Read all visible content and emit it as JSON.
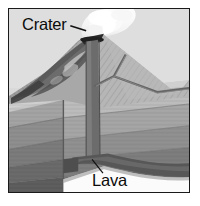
{
  "figure": {
    "kind": "labeled-diagram",
    "frame": {
      "border_color": "#1a1a1a",
      "background_color": "#d9d9d9"
    }
  },
  "labels": [
    {
      "id": "crater",
      "text": "Crater",
      "color": "#0b0b0b",
      "leader": "line from text right edge to volcano summit vent"
    },
    {
      "id": "lava",
      "text": "Lava",
      "color": "#0b0b0b",
      "leader": "line from text up-right to the magma conduit base"
    }
  ],
  "scene": {
    "sky_color": "#d8d8d8",
    "plume": {
      "name": "smoke-plume",
      "color": "#f2f2f2"
    },
    "cone": {
      "name": "volcano-cone",
      "light_face_color": "#b4b4b4",
      "shadow_face_color": "#8e8e8e",
      "hatching": true
    },
    "conduit": {
      "name": "magma-conduit",
      "color": "#6a6a6a"
    },
    "dike": {
      "name": "branching-dike",
      "color": "#6f6f6f"
    },
    "lava_flows": {
      "name": "old-lava-flow-layers",
      "color": "#555555"
    },
    "strata": [
      {
        "id": "layer-1",
        "name": "topsoil-layer",
        "top_color": "#c3c3c3",
        "side_color": "#9d9d9d"
      },
      {
        "id": "layer-2",
        "name": "upper-rock-layer",
        "top_color": "#b0b0b0",
        "side_color": "#8f8f8f"
      },
      {
        "id": "layer-3",
        "name": "middle-rock-layer",
        "top_color": "#9a9a9a",
        "side_color": "#7d7d7d"
      },
      {
        "id": "layer-4",
        "name": "lower-rock-layer",
        "top_color": "#868686",
        "side_color": "#6d6d6d"
      },
      {
        "id": "layer-5",
        "name": "deep-rock-layer",
        "top_color": "#747474",
        "side_color": "#5e5e5e"
      }
    ],
    "magma_reservoir": {
      "name": "magma-reservoir",
      "color": "#5a5a5a"
    }
  }
}
